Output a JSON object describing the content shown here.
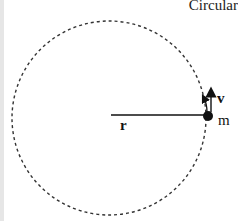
{
  "title": "Circular",
  "diagram": {
    "labels": {
      "radius": "r",
      "velocity": "v",
      "mass": "m"
    },
    "elements": [
      {
        "name": "circular-path",
        "style": "dashed"
      },
      {
        "name": "radius-line",
        "from": "center",
        "to": "mass"
      },
      {
        "name": "mass-dot"
      },
      {
        "name": "velocity-arrow",
        "direction": "up (tangent)"
      },
      {
        "name": "motion-arrow",
        "direction": "counter-clockwise along path"
      }
    ]
  },
  "colors": {
    "ink": "#111111",
    "path": "#333333",
    "background": "#ffffff"
  }
}
